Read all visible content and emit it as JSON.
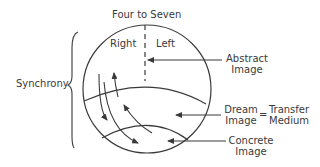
{
  "diagram": {
    "title": "Four to Seven",
    "left_bracket_label": "Synchrony",
    "hemispheres": {
      "right": "Right",
      "left": "Left"
    },
    "annotations": [
      {
        "line1": "Abstract",
        "line2": "Image"
      },
      {
        "line1": "Dream",
        "line2": "Image"
      },
      {
        "line1": "Concrete",
        "line2": "Image"
      }
    ],
    "equals_sign": "=",
    "transfer": {
      "line1": "Transfer",
      "line2": "Medium"
    },
    "colors": {
      "stroke": "#3a3a3a",
      "text": "#3a3a3a",
      "background": "#ffffff"
    }
  }
}
